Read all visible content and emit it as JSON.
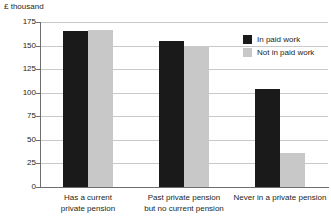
{
  "chart_data": {
    "type": "bar",
    "title": "",
    "subtitle": "",
    "xlabel": "",
    "ylabel": "£ thousand",
    "ylim": [
      0,
      175
    ],
    "yticks": [
      0,
      25,
      50,
      75,
      100,
      125,
      150,
      175
    ],
    "ytick_labels": [
      "0",
      "25",
      "50",
      "75",
      "100",
      "125",
      "150",
      "175"
    ],
    "grid": true,
    "legend_position": "top-right",
    "categories": [
      "Has a current private pension",
      "Past private pension but no current pension",
      "Never in a private pension"
    ],
    "category_lines": [
      [
        "Has a current",
        "private pension"
      ],
      [
        "Past private pension",
        "but no current pension"
      ],
      [
        "Never in a private pension"
      ]
    ],
    "series": [
      {
        "name": "In paid work",
        "color": "#1a1a1a",
        "values": [
          166,
          155,
          104
        ]
      },
      {
        "name": "Not in paid work",
        "color": "#c8c8c8",
        "values": [
          167,
          148,
          36
        ]
      }
    ]
  },
  "axis": {
    "unit_label": "£ thousand"
  },
  "legend": {
    "items": [
      {
        "label": "In paid work",
        "color": "#1a1a1a"
      },
      {
        "label": "Not in paid work",
        "color": "#c8c8c8"
      }
    ]
  },
  "colors": {
    "paid": "#1a1a1a",
    "not_paid": "#c8c8c8",
    "gridline": "#c9c9c9",
    "axis": "#6d6e71",
    "text": "#231f20",
    "background": "#ffffff"
  }
}
